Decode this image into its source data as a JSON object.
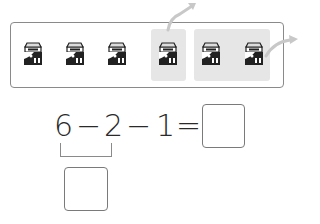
{
  "picture": {
    "item_icon": "milk-carton-icon",
    "item_count": 6,
    "items": [
      {
        "x": 22,
        "highlighted": false
      },
      {
        "x": 64,
        "highlighted": false
      },
      {
        "x": 106,
        "highlighted": false
      },
      {
        "x": 157,
        "highlighted": true,
        "group": 1
      },
      {
        "x": 200,
        "highlighted": true,
        "group": 2
      },
      {
        "x": 243,
        "highlighted": true,
        "group": 2
      }
    ],
    "highlight_color": "#e6e6e6",
    "arrows": [
      "taken-away-1-arrow",
      "taken-away-2-arrow"
    ]
  },
  "equation": {
    "n1": "6",
    "op1": "−",
    "n2": "2",
    "op2": "−",
    "n3": "1",
    "eq": "=",
    "answer_box": "",
    "intermediate_box": ""
  }
}
